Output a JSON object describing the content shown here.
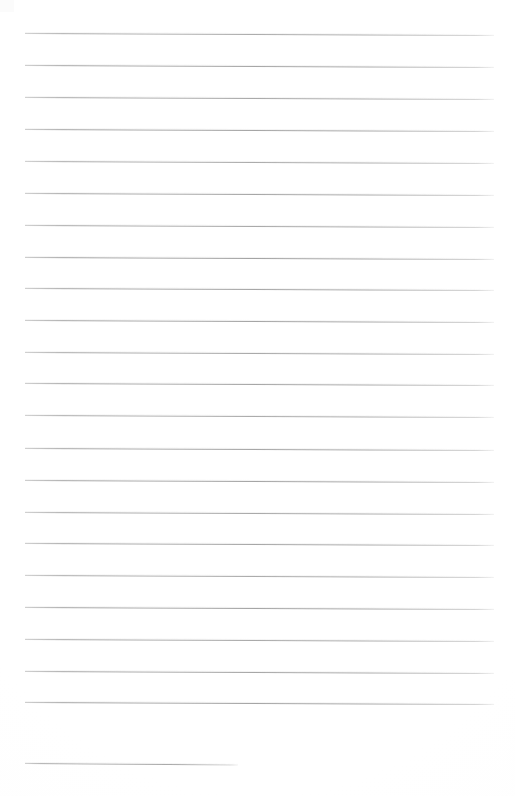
{
  "document": {
    "kind": "lined-paper-scan",
    "title": "Blank ruled notebook page",
    "page_width": 515,
    "page_height": 796,
    "background_color": "#ffffff",
    "rule_color": "#9a9a9a",
    "has_text_content": false,
    "visible_text": "",
    "margin_left": 25,
    "margin_right": 494,
    "line_spacing": 31.8,
    "first_line_y": 33,
    "line_count": 23
  },
  "rules": [
    {
      "index": 1,
      "y": 33,
      "x_start": 25,
      "x_end": 494,
      "slope": 2.0,
      "opacity": 0.85,
      "full_width": true
    },
    {
      "index": 2,
      "y": 65,
      "x_start": 25,
      "x_end": 494,
      "slope": 2.0,
      "opacity": 0.9,
      "full_width": true
    },
    {
      "index": 3,
      "y": 97,
      "x_start": 25,
      "x_end": 494,
      "slope": 2.0,
      "opacity": 0.88,
      "full_width": true
    },
    {
      "index": 4,
      "y": 129,
      "x_start": 25,
      "x_end": 494,
      "slope": 2.0,
      "opacity": 0.92,
      "full_width": true
    },
    {
      "index": 5,
      "y": 161,
      "x_start": 25,
      "x_end": 494,
      "slope": 2.0,
      "opacity": 0.86,
      "full_width": true
    },
    {
      "index": 6,
      "y": 193,
      "x_start": 25,
      "x_end": 494,
      "slope": 2.0,
      "opacity": 0.9,
      "full_width": true
    },
    {
      "index": 7,
      "y": 225,
      "x_start": 25,
      "x_end": 494,
      "slope": 2.0,
      "opacity": 0.88,
      "full_width": true
    },
    {
      "index": 8,
      "y": 257,
      "x_start": 25,
      "x_end": 494,
      "slope": 2.0,
      "opacity": 0.94,
      "full_width": true
    },
    {
      "index": 9,
      "y": 288,
      "x_start": 25,
      "x_end": 494,
      "slope": 2.0,
      "opacity": 0.9,
      "full_width": true
    },
    {
      "index": 10,
      "y": 320,
      "x_start": 25,
      "x_end": 494,
      "slope": 2.0,
      "opacity": 0.92,
      "full_width": true
    },
    {
      "index": 11,
      "y": 352,
      "x_start": 25,
      "x_end": 494,
      "slope": 2.0,
      "opacity": 0.88,
      "full_width": true
    },
    {
      "index": 12,
      "y": 383,
      "x_start": 25,
      "x_end": 494,
      "slope": 2.0,
      "opacity": 0.9,
      "full_width": true
    },
    {
      "index": 13,
      "y": 415,
      "x_start": 25,
      "x_end": 494,
      "slope": 2.0,
      "opacity": 0.86,
      "full_width": true
    },
    {
      "index": 14,
      "y": 448,
      "x_start": 25,
      "x_end": 494,
      "slope": 2.0,
      "opacity": 0.9,
      "full_width": true
    },
    {
      "index": 15,
      "y": 480,
      "x_start": 25,
      "x_end": 494,
      "slope": 2.0,
      "opacity": 0.92,
      "full_width": true
    },
    {
      "index": 16,
      "y": 512,
      "x_start": 25,
      "x_end": 494,
      "slope": 2.0,
      "opacity": 0.88,
      "full_width": true
    },
    {
      "index": 17,
      "y": 543,
      "x_start": 25,
      "x_end": 494,
      "slope": 2.0,
      "opacity": 0.9,
      "full_width": true
    },
    {
      "index": 18,
      "y": 575,
      "x_start": 25,
      "x_end": 494,
      "slope": 2.0,
      "opacity": 0.86,
      "full_width": true
    },
    {
      "index": 19,
      "y": 607,
      "x_start": 25,
      "x_end": 494,
      "slope": 2.0,
      "opacity": 0.92,
      "full_width": true
    },
    {
      "index": 20,
      "y": 639,
      "x_start": 25,
      "x_end": 494,
      "slope": 2.0,
      "opacity": 0.88,
      "full_width": true
    },
    {
      "index": 21,
      "y": 671,
      "x_start": 25,
      "x_end": 494,
      "slope": 2.0,
      "opacity": 0.9,
      "full_width": true
    },
    {
      "index": 22,
      "y": 702,
      "x_start": 25,
      "x_end": 494,
      "slope": 2.0,
      "opacity": 0.92,
      "full_width": true
    },
    {
      "index": 23,
      "y": 763,
      "x_start": 25,
      "x_end": 238,
      "slope": 1.5,
      "opacity": 0.85,
      "full_width": false
    }
  ]
}
